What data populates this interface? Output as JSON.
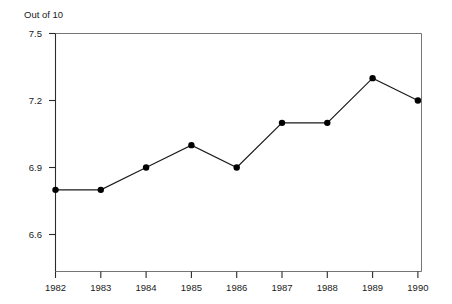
{
  "chart_data": {
    "type": "line",
    "title": "",
    "ylabel_top_note": "Out of 10",
    "xlabel": "",
    "ylabel": "",
    "categories": [
      "1982",
      "1983",
      "1984",
      "1985",
      "1986",
      "1987",
      "1988",
      "1989",
      "1990"
    ],
    "x": [
      1982,
      1983,
      1984,
      1985,
      1986,
      1987,
      1988,
      1989,
      1990
    ],
    "values": [
      6.8,
      6.8,
      6.9,
      7.0,
      6.9,
      7.1,
      7.1,
      7.3,
      7.2
    ],
    "series": [
      {
        "name": "Out of 10",
        "values": [
          6.8,
          6.8,
          6.9,
          7.0,
          6.9,
          7.1,
          7.1,
          7.3,
          7.2
        ]
      }
    ],
    "ylim": [
      6.49,
      7.5
    ],
    "yticks": [
      "7.5",
      "7.2",
      "6.9",
      "6.6"
    ],
    "ytick_values": [
      7.5,
      7.2,
      6.9,
      6.6
    ],
    "xticks": [
      "1982",
      "1983",
      "1984",
      "1985",
      "1986",
      "1987",
      "1988",
      "1989",
      "1990"
    ],
    "grid": false,
    "legend": false,
    "legend_position": "none",
    "marker": "filled-circle",
    "line_color": "#1a1a1a",
    "marker_color": "#000000",
    "axis_color": "#666666",
    "plot_background": "#ffffff"
  },
  "axis": {
    "top_note": "Out of 10",
    "y_ticks": [
      {
        "label": "7.5",
        "value": 7.5
      },
      {
        "label": "7.2",
        "value": 7.2
      },
      {
        "label": "6.9",
        "value": 6.9
      },
      {
        "label": "6.6",
        "value": 6.6
      }
    ],
    "x_ticks": [
      {
        "label": "1982"
      },
      {
        "label": "1983"
      },
      {
        "label": "1984"
      },
      {
        "label": "1985"
      },
      {
        "label": "1986"
      },
      {
        "label": "1987"
      },
      {
        "label": "1988"
      },
      {
        "label": "1989"
      },
      {
        "label": "1990"
      }
    ]
  }
}
